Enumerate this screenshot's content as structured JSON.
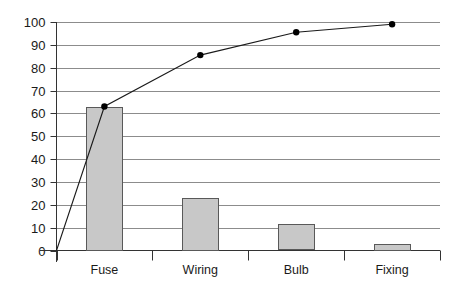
{
  "chart_data": {
    "type": "bar",
    "title": "",
    "xlabel": "",
    "ylabel": "",
    "categories": [
      "Fuse",
      "Wiring",
      "Bulb",
      "Fixing"
    ],
    "values": [
      63,
      23,
      11.5,
      3
    ],
    "ylim": [
      0,
      100
    ],
    "yticks": [
      0,
      10,
      20,
      30,
      40,
      50,
      60,
      70,
      80,
      90,
      100
    ],
    "ytick_labels": [
      "0",
      "10",
      "20",
      "30",
      "40",
      "50",
      "60",
      "70",
      "80",
      "90",
      "100"
    ],
    "grid": true,
    "legend": "none",
    "series": [
      {
        "name": "Count",
        "type": "bar",
        "values": [
          63,
          23,
          11.5,
          3
        ]
      },
      {
        "name": "Cumulative %",
        "type": "line",
        "values": [
          63,
          85.5,
          95.5,
          99
        ],
        "markers": true
      }
    ],
    "line_origin_value": 0,
    "colors": {
      "bar_fill": "#c8c8c8",
      "bar_edge": "#595959",
      "line": "#1a1a1a",
      "marker": "#000000",
      "grid": "#8c8c8c",
      "axis": "#333333",
      "text": "#1a1a1a",
      "background": "#ffffff"
    }
  },
  "axes": {
    "y_axis_name": "value-axis",
    "x_axis_name": "category-axis"
  }
}
